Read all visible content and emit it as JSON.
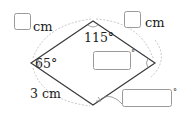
{
  "figure": {
    "shape": "parallelogram-rhombus",
    "vertices": {
      "left": [
        31,
        63
      ],
      "top": [
        93,
        21
      ],
      "right": [
        155,
        63
      ],
      "bottom": [
        93,
        105
      ]
    },
    "angles": {
      "top_label": "115°",
      "left_label": "65°"
    },
    "sides": {
      "bottom_left_label": "3 cm"
    },
    "answer_boxes": [
      {
        "id": "top-left-side",
        "unit": "cm",
        "value": ""
      },
      {
        "id": "top-right-side",
        "unit": "cm",
        "value": ""
      },
      {
        "id": "right-angle",
        "unit": "°",
        "value": ""
      },
      {
        "id": "bottom-angle",
        "unit": "°",
        "value": ""
      }
    ],
    "colors": {
      "edge": "#3a3a3a",
      "box_border": "#9a9a9a",
      "dashed_arc": "#b8b8b8"
    }
  }
}
